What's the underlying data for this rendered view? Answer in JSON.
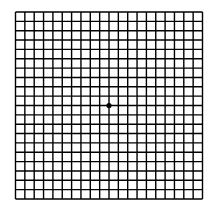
{
  "diagram": {
    "type": "amsler-grid",
    "rows": 20,
    "cols": 20,
    "left": 15.5,
    "top": 12,
    "size": 187,
    "line_color": "#000000",
    "background": "#ffffff",
    "center_dot": true
  }
}
